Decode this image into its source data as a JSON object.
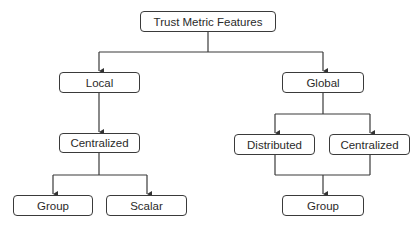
{
  "diagram": {
    "type": "tree",
    "nodes": {
      "root": {
        "label": "Trust Metric Features"
      },
      "local": {
        "label": "Local"
      },
      "global": {
        "label": "Global"
      },
      "local_centralized": {
        "label": "Centralized"
      },
      "global_distributed": {
        "label": "Distributed"
      },
      "global_centralized": {
        "label": "Centralized"
      },
      "local_group": {
        "label": "Group"
      },
      "local_scalar": {
        "label": "Scalar"
      },
      "global_group": {
        "label": "Group"
      }
    },
    "edges": [
      [
        "root",
        "local"
      ],
      [
        "root",
        "global"
      ],
      [
        "local",
        "local_centralized"
      ],
      [
        "local_centralized",
        "local_group"
      ],
      [
        "local_centralized",
        "local_scalar"
      ],
      [
        "global",
        "global_distributed"
      ],
      [
        "global",
        "global_centralized"
      ],
      [
        "global_distributed",
        "global_group"
      ],
      [
        "global_centralized",
        "global_group"
      ]
    ]
  }
}
